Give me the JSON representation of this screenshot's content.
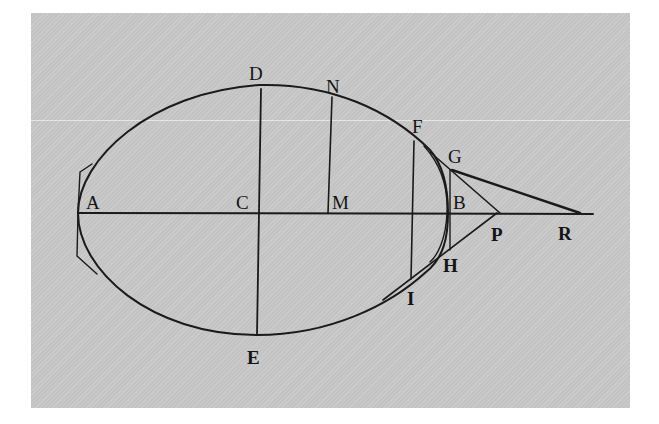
{
  "figure": {
    "background_color": "#c9c9c9",
    "ink_color": "#1a1a1a",
    "labels": {
      "A": "A",
      "B": "B",
      "C": "C",
      "D": "D",
      "E": "E",
      "F": "F",
      "G": "G",
      "H": "H",
      "I": "I",
      "M": "M",
      "N": "N",
      "P": "P",
      "R": "R"
    }
  }
}
